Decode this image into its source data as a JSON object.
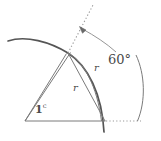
{
  "figure": {
    "type": "geometry-diagram",
    "background_color": "#ffffff",
    "stroke_color_thick": "#555555",
    "stroke_color_thin": "#7a7a7a",
    "stroke_color_dotted": "#9a9a9a",
    "label_color": "#4a4a4a"
  },
  "labels": {
    "angle_degrees": "60",
    "angle_degree_symbol": "°",
    "radian_value": "1",
    "radian_superscript": "c",
    "radius_lower": "r",
    "radius_upper": "r"
  },
  "geometry": {
    "center": {
      "x": 25,
      "y": 121
    },
    "arc_vertex": {
      "x": 68,
      "y": 53
    },
    "baseline_end": {
      "x": 105,
      "y": 121
    },
    "dotted_baseline_end": {
      "x": 141,
      "y": 121
    },
    "dotted_ray_top": {
      "x": 93,
      "y": 5
    },
    "arrow_tip": {
      "x": 80,
      "y": 27
    },
    "degree_arc_start": {
      "x": 136,
      "y": 55
    },
    "degree_arc_end": {
      "x": 137,
      "y": 121
    },
    "thick_arc_start": {
      "x": 8,
      "y": 41
    },
    "thick_arc_end": {
      "x": 104,
      "y": 132
    }
  }
}
